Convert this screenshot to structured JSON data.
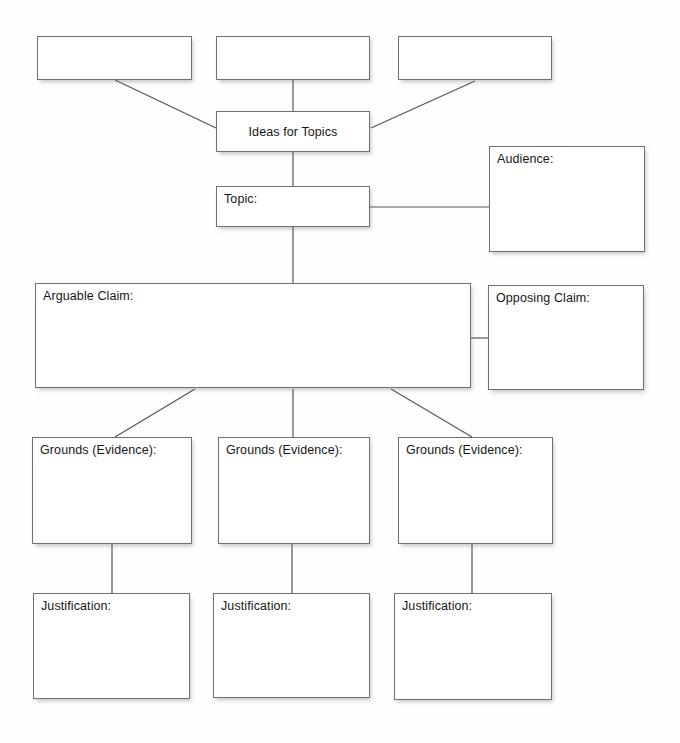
{
  "diagram": {
    "background_color": "#fefefe",
    "box_border_color": "#707070",
    "box_fill_color": "#ffffff",
    "connector_color": "#555555",
    "text_color": "#161616"
  },
  "nodes": [
    {
      "id": "idea-blank-1",
      "label": "",
      "x": 37,
      "y": 36,
      "w": 155,
      "h": 44,
      "align": "left"
    },
    {
      "id": "idea-blank-2",
      "label": "",
      "x": 216,
      "y": 36,
      "w": 154,
      "h": 44,
      "align": "left"
    },
    {
      "id": "idea-blank-3",
      "label": "",
      "x": 398,
      "y": 36,
      "w": 154,
      "h": 44,
      "align": "left"
    },
    {
      "id": "ideas-for-topics",
      "label": "Ideas for Topics",
      "x": 216,
      "y": 111,
      "w": 154,
      "h": 41,
      "align": "center"
    },
    {
      "id": "topic",
      "label": "Topic:",
      "x": 216,
      "y": 186,
      "w": 154,
      "h": 41,
      "align": "left"
    },
    {
      "id": "audience",
      "label": "Audience:",
      "x": 489,
      "y": 146,
      "w": 156,
      "h": 106,
      "align": "left"
    },
    {
      "id": "arguable-claim",
      "label": "Arguable Claim:",
      "x": 35,
      "y": 283,
      "w": 436,
      "h": 105,
      "align": "left"
    },
    {
      "id": "opposing-claim",
      "label": "Opposing Claim:",
      "x": 488,
      "y": 285,
      "w": 156,
      "h": 105,
      "align": "left"
    },
    {
      "id": "grounds-evidence-1",
      "label": "Grounds (Evidence):",
      "x": 32,
      "y": 437,
      "w": 160,
      "h": 107,
      "align": "left"
    },
    {
      "id": "grounds-evidence-2",
      "label": "Grounds (Evidence):",
      "x": 218,
      "y": 437,
      "w": 152,
      "h": 107,
      "align": "left"
    },
    {
      "id": "grounds-evidence-3",
      "label": "Grounds (Evidence):",
      "x": 398,
      "y": 437,
      "w": 155,
      "h": 107,
      "align": "left"
    },
    {
      "id": "justification-1",
      "label": "Justification:",
      "x": 33,
      "y": 593,
      "w": 157,
      "h": 106,
      "align": "left"
    },
    {
      "id": "justification-2",
      "label": "Justification:",
      "x": 213,
      "y": 593,
      "w": 157,
      "h": 105,
      "align": "left"
    },
    {
      "id": "justification-3",
      "label": "Justification:",
      "x": 394,
      "y": 593,
      "w": 158,
      "h": 107,
      "align": "left"
    }
  ],
  "connectors": [
    {
      "id": "blank1-to-ideas",
      "from": "idea-blank-1",
      "to": "ideas-for-topics",
      "x1": 115,
      "y1": 80,
      "x2": 216,
      "y2": 128
    },
    {
      "id": "blank2-to-ideas",
      "from": "idea-blank-2",
      "to": "ideas-for-topics",
      "x1": 293,
      "y1": 80,
      "x2": 293,
      "y2": 111
    },
    {
      "id": "blank3-to-ideas",
      "from": "idea-blank-3",
      "to": "ideas-for-topics",
      "x1": 475,
      "y1": 81,
      "x2": 371,
      "y2": 128
    },
    {
      "id": "ideas-to-topic",
      "from": "ideas-for-topics",
      "to": "topic",
      "x1": 293,
      "y1": 152,
      "x2": 293,
      "y2": 186
    },
    {
      "id": "topic-to-audience",
      "from": "topic",
      "to": "audience",
      "x1": 370,
      "y1": 207,
      "x2": 489,
      "y2": 207
    },
    {
      "id": "topic-to-arguable-claim",
      "from": "topic",
      "to": "arguable-claim",
      "x1": 293,
      "y1": 227,
      "x2": 293,
      "y2": 283
    },
    {
      "id": "arguable-to-opposing",
      "from": "arguable-claim",
      "to": "opposing-claim",
      "x1": 471,
      "y1": 338,
      "x2": 488,
      "y2": 338
    },
    {
      "id": "arguable-to-grounds1",
      "from": "arguable-claim",
      "to": "grounds-evidence-1",
      "x1": 195,
      "y1": 389,
      "x2": 115,
      "y2": 437
    },
    {
      "id": "arguable-to-grounds2",
      "from": "arguable-claim",
      "to": "grounds-evidence-2",
      "x1": 293,
      "y1": 389,
      "x2": 293,
      "y2": 437
    },
    {
      "id": "arguable-to-grounds3",
      "from": "arguable-claim",
      "to": "grounds-evidence-3",
      "x1": 391,
      "y1": 389,
      "x2": 472,
      "y2": 437
    },
    {
      "id": "grounds1-to-justification1",
      "from": "grounds-evidence-1",
      "to": "justification-1",
      "x1": 112,
      "y1": 544,
      "x2": 112,
      "y2": 593
    },
    {
      "id": "grounds2-to-justification2",
      "from": "grounds-evidence-2",
      "to": "justification-2",
      "x1": 292,
      "y1": 544,
      "x2": 292,
      "y2": 593
    },
    {
      "id": "grounds3-to-justification3",
      "from": "grounds-evidence-3",
      "to": "justification-3",
      "x1": 472,
      "y1": 544,
      "x2": 472,
      "y2": 593
    }
  ]
}
